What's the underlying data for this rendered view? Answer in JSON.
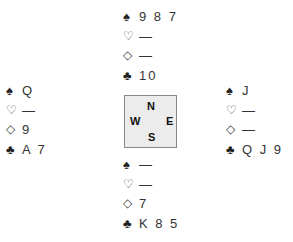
{
  "suits": {
    "spades": "♠",
    "hearts": "♡",
    "diamonds": "◇",
    "clubs": "♣"
  },
  "hands": {
    "north": {
      "spades": "9 8 7",
      "hearts": "—",
      "diamonds": "—",
      "clubs": "10"
    },
    "west": {
      "spades": "Q",
      "hearts": "—",
      "diamonds": "9",
      "clubs": "A 7"
    },
    "east": {
      "spades": "J",
      "hearts": "—",
      "diamonds": "—",
      "clubs": "Q J 9"
    },
    "south": {
      "spades": "—",
      "hearts": "—",
      "diamonds": "7",
      "clubs": "K 8 5"
    }
  },
  "compass": {
    "north": "N",
    "south": "S",
    "west": "W",
    "east": "E"
  }
}
